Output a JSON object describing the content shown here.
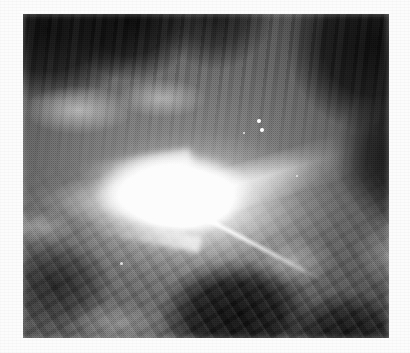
{
  "image": {
    "title": "Astronomical photographic plate",
    "subject": "Bright central source with radiating jets in mottled nebulosity",
    "medium": "grayscale halftone scan",
    "caption": "",
    "canvas": {
      "width": 410,
      "height": 353
    },
    "background_color": "#fcfcfc",
    "plate": {
      "x": 23,
      "y": 14,
      "width": 366,
      "height": 324,
      "mean_tone": "#6a6a6a",
      "darkest": "#101010",
      "brightest": "#ffffff"
    },
    "features": [
      {
        "name": "central-core",
        "kind": "saturated-highlight",
        "center_x": 175,
        "center_y": 192,
        "width": 160,
        "height": 82,
        "color": "#ffffff"
      },
      {
        "name": "jet-upper-right",
        "kind": "jet",
        "angle_deg": -17,
        "length": 215,
        "color": "#f7f7f7"
      },
      {
        "name": "plume-left",
        "kind": "plume",
        "angle_deg": 0,
        "length": 175,
        "color": "#fafafa"
      },
      {
        "name": "jet-lower-right",
        "kind": "thin-streak",
        "angle_deg": 28,
        "length": 150,
        "color": "#f5f5f5"
      },
      {
        "name": "ray-lower-left",
        "kind": "faint-ray",
        "angle_deg": 11,
        "length": 120,
        "color": "#f0f0f0"
      },
      {
        "name": "ray-upper-left",
        "kind": "faint-ray",
        "angle_deg": -9,
        "length": 115,
        "color": "#f0f0f0"
      },
      {
        "name": "dark-cloud-upper-left",
        "kind": "dark-nebula",
        "color": "#141414"
      },
      {
        "name": "dark-cloud-upper-right",
        "kind": "dark-nebula",
        "color": "#151515"
      },
      {
        "name": "dark-cloud-lower-center",
        "kind": "dark-nebula",
        "color": "#141414"
      },
      {
        "name": "vertical-striations",
        "kind": "filaments",
        "region": "upper-half"
      },
      {
        "name": "diagonal-filaments",
        "kind": "filaments",
        "region": "lower-half"
      }
    ],
    "stars": [
      {
        "name": "star-a",
        "x": 257,
        "y": 119,
        "size": 4
      },
      {
        "name": "star-b",
        "x": 260,
        "y": 128,
        "size": 4
      },
      {
        "name": "star-c",
        "x": 243,
        "y": 132,
        "size": 2
      },
      {
        "name": "star-d",
        "x": 120,
        "y": 262,
        "size": 3
      },
      {
        "name": "star-e",
        "x": 296,
        "y": 175,
        "size": 2
      }
    ]
  }
}
